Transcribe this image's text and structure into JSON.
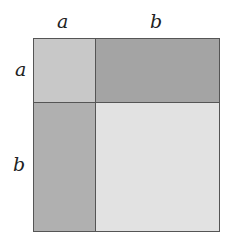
{
  "labels": {
    "top_a": "a",
    "top_b": "b",
    "left_a": "a",
    "left_b": "b"
  },
  "regions": {
    "a_by_a": {
      "color": "#c8c8c8"
    },
    "b_by_a_top": {
      "color": "#a4a4a4"
    },
    "a_by_b_left": {
      "color": "#b0b0b0"
    },
    "b_by_b": {
      "color": "#e2e2e2"
    }
  }
}
